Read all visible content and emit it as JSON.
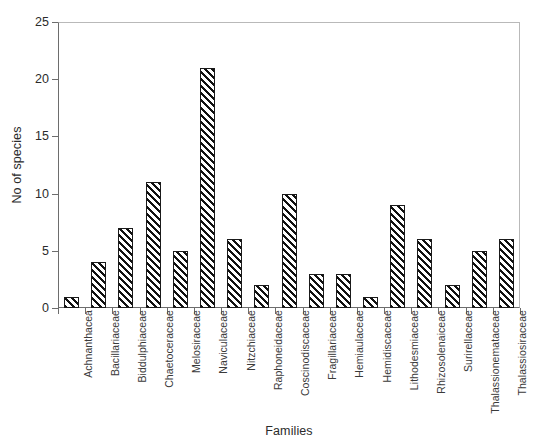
{
  "chart_data": {
    "type": "bar",
    "title": "",
    "xlabel": "Families",
    "ylabel": "No of species",
    "ylim": [
      0,
      25
    ],
    "ytick_values": [
      0,
      5,
      10,
      15,
      20,
      25
    ],
    "ytick_labels": [
      "0",
      "5",
      "10",
      "15",
      "20",
      "25"
    ],
    "grid": false,
    "legend": false,
    "bar_style": "diagonal-hatch-black-on-white",
    "categories": [
      "Achnanthacea",
      "Bacillariaceae",
      "Biddulphiaceae",
      "Chaetoceraceae",
      "Melosiraceae",
      "Naviculaceae",
      "Nitzchiaceae",
      "Raphoneidaceae",
      "Coscinodiscaceae",
      "Fragillariaceae",
      "Hemiaulaceae",
      "Hemidiscaceae",
      "Lithodesmiaceae",
      "Rhizosolenaiceae",
      "Surirellaceae",
      "Thalassionemataceae",
      "Thalassiosiraceae"
    ],
    "values": [
      1,
      4,
      7,
      11,
      5,
      21,
      6,
      2,
      10,
      3,
      3,
      1,
      9,
      6,
      2,
      5,
      6
    ]
  },
  "axis": {
    "y_title": "No of species",
    "x_title": "Families"
  }
}
